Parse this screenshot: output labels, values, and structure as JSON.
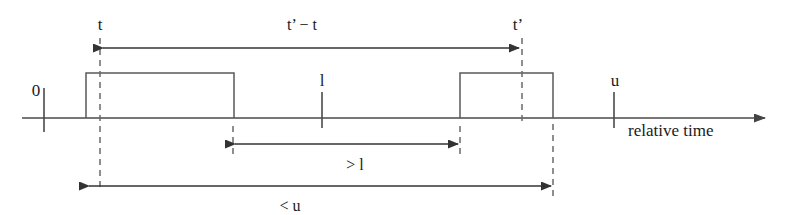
{
  "figure": {
    "kind": "timing-diagram",
    "background_color": "#ffffff",
    "line_color": "#4a4a4a",
    "text_color": "#1a1a1a"
  },
  "axis": {
    "label": "relative time",
    "ticks": [
      {
        "name": "origin",
        "label": "0",
        "x": 44
      },
      {
        "name": "lower-bound",
        "label": "l",
        "x": 322
      },
      {
        "name": "upper-bound",
        "label": "u",
        "x": 614
      }
    ]
  },
  "events": [
    {
      "name": "t",
      "label": "t",
      "x": 100
    },
    {
      "name": "t-prime",
      "label": "t’",
      "x": 522
    }
  ],
  "pulses": [
    {
      "name": "first-pulse",
      "x_start": 86,
      "x_end": 234
    },
    {
      "name": "second-pulse",
      "x_start": 460,
      "x_end": 553
    }
  ],
  "measures": [
    {
      "name": "t-prime-minus-t",
      "label": "t’ − t",
      "x_start": 100,
      "x_end": 522,
      "y": 48,
      "label_x": 302,
      "label_y": 28
    },
    {
      "name": "greater-than-l",
      "label": "> l",
      "x_start": 232,
      "x_end": 460,
      "y": 144,
      "label_x": 355,
      "label_y": 168
    },
    {
      "name": "less-than-u",
      "label": "< u",
      "x_start": 86,
      "x_end": 553,
      "y": 186,
      "label_x": 290,
      "label_y": 208
    }
  ]
}
